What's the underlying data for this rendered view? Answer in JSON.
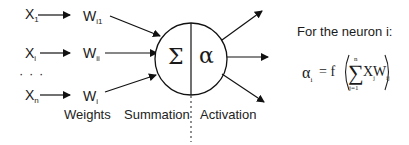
{
  "inputs": [
    {
      "x_label": "X",
      "x_sub": "1",
      "w_label": "W",
      "w_sub": "i1"
    },
    {
      "x_label": "X",
      "x_sub": "i",
      "w_label": "W",
      "w_sub": "ii"
    },
    {
      "x_label": "X",
      "x_sub": "n",
      "w_label": "W",
      "w_sub": "i"
    }
  ],
  "ellipsis": "· · ·",
  "neuron": {
    "summation_symbol": "Σ",
    "activation_symbol": "α"
  },
  "labels": {
    "weights": "Weights",
    "summation": "Summation",
    "activation": "Activation"
  },
  "formula": {
    "heading": "For the neuron i:",
    "lhs": "α",
    "lhs_sub": "i",
    "equals": "= f",
    "sum_symbol": "∑",
    "upper": "n",
    "lower": "j=1",
    "term_x": "X",
    "term_x_sub": "j",
    "term_w": "W",
    "term_w_sub": "ij"
  }
}
